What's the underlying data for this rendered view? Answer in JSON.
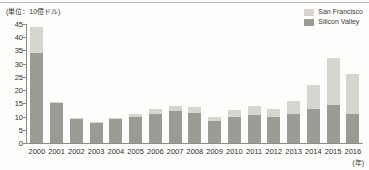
{
  "figure": {
    "unit_note": "(単位：10億ドル)",
    "x_axis_unit": "(年)"
  },
  "legend": {
    "position": "top-right",
    "entries": [
      {
        "label": "San Francisco",
        "color": "#d6d6ce"
      },
      {
        "label": "Silicon Valley",
        "color": "#9b9b93"
      }
    ]
  },
  "chart_data": {
    "type": "bar",
    "stacked": true,
    "title": "",
    "xlabel": "(年)",
    "ylabel": "(単位：10億ドル)",
    "ylim": [
      0,
      45
    ],
    "yticks": [
      0,
      5,
      10,
      15,
      20,
      25,
      30,
      35,
      40,
      45
    ],
    "ytick_labels": [
      "0",
      "5",
      "10",
      "15",
      "20",
      "25",
      "30",
      "35",
      "40",
      "45"
    ],
    "grid": false,
    "legend_position": "top-right",
    "categories": [
      "2000",
      "2001",
      "2002",
      "2003",
      "2004",
      "2005",
      "2006",
      "2007",
      "2008",
      "2009",
      "2010",
      "2011",
      "2012",
      "2013",
      "2014",
      "2015",
      "2016"
    ],
    "series": [
      {
        "name": "Silicon Valley",
        "color": "#9b9b93",
        "values": [
          34,
          15,
          9,
          7.5,
          9,
          10,
          11,
          12,
          11.5,
          8.5,
          10,
          10.5,
          10,
          11,
          13,
          14.5,
          11
        ]
      },
      {
        "name": "San Francisco",
        "color": "#d6d6ce",
        "values": [
          10,
          0.5,
          0.5,
          0.5,
          0.5,
          1,
          2,
          2,
          2,
          1.5,
          2.5,
          3.5,
          3,
          5,
          9,
          17.5,
          15
        ]
      }
    ],
    "totals": [
      44,
      15.5,
      9.5,
      8,
      9.5,
      11,
      13,
      14,
      13.5,
      10,
      12.5,
      14,
      13,
      16,
      22,
      32,
      26
    ]
  }
}
